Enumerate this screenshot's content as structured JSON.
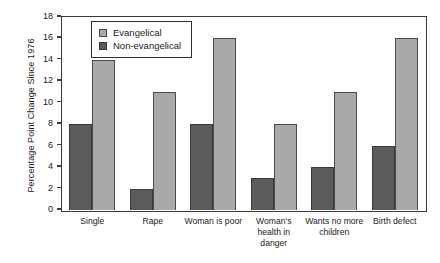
{
  "chart_data": {
    "type": "bar",
    "title": "",
    "xlabel": "",
    "ylabel": "Percentage Point Change Since 1976",
    "ylim": [
      0,
      18
    ],
    "ytick_step": 2,
    "yticks": [
      18,
      16,
      14,
      12,
      10,
      8,
      6,
      4,
      2,
      0
    ],
    "grid": false,
    "legend_position": "top-left-inside",
    "categories": [
      "Single",
      "Rape",
      "Woman is poor",
      "Woman's health in danger",
      "Wants no more children",
      "Birth defect"
    ],
    "series": [
      {
        "name": "Non-evangelical",
        "color": "#5b5b5b",
        "values": [
          8,
          2,
          8,
          3,
          4,
          6
        ]
      },
      {
        "name": "Evangelical",
        "color": "#a9a9a9",
        "values": [
          14,
          11,
          16,
          8,
          11,
          16
        ]
      }
    ]
  },
  "legend": {
    "items": [
      {
        "label": "Evangelical",
        "swatch": "evangelical"
      },
      {
        "label": "Non-evangelical",
        "swatch": "non-evangelical"
      }
    ]
  },
  "axes": {
    "y_title": "Percentage Point Change Since 1976",
    "y_tick_labels": [
      "18",
      "16",
      "14",
      "12",
      "10",
      "8",
      "6",
      "4",
      "2",
      "0"
    ],
    "x_tick_labels": [
      "Single",
      "Rape",
      "Woman is poor",
      "Woman's health in danger",
      "Wants no more children",
      "Birth defect"
    ]
  },
  "colors": {
    "evangelical": "#a9a9a9",
    "non_evangelical": "#5b5b5b",
    "frame": "#3b3b3b",
    "background": "#ffffff"
  }
}
